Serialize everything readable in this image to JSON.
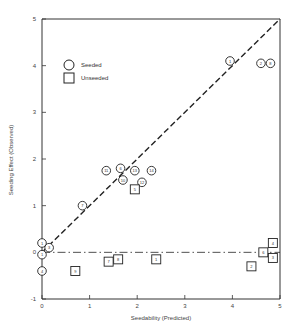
{
  "chart_data": {
    "type": "scatter",
    "title": "",
    "xlabel": "Seedability (Predicted)",
    "ylabel": "Seeding Effect (Observed)",
    "xlim": [
      0,
      5
    ],
    "ylim": [
      -1,
      5
    ],
    "x_ticks": [
      "0",
      "1",
      "2",
      "3",
      "4",
      "5"
    ],
    "y_ticks": [
      "-1",
      "0",
      "1",
      "2",
      "3",
      "4",
      "5"
    ],
    "grid": false,
    "legend": {
      "position": "upper-left",
      "entries": [
        {
          "label": "Seeded",
          "marker": "circle"
        },
        {
          "label": "Unseeded",
          "marker": "square"
        }
      ]
    },
    "reference_lines": [
      {
        "name": "identity",
        "style": "dashed",
        "from": [
          0,
          0
        ],
        "to": [
          5,
          5
        ]
      },
      {
        "name": "zero",
        "style": "dash-dot",
        "from": [
          0,
          0
        ],
        "to": [
          5,
          0
        ]
      }
    ],
    "series": [
      {
        "name": "Seeded",
        "marker": "circle",
        "points": [
          {
            "label": "1",
            "x": 0.0,
            "y": 0.2
          },
          {
            "label": "1",
            "x": 0.0,
            "y": -0.05
          },
          {
            "label": "3",
            "x": 0.15,
            "y": 0.1
          },
          {
            "label": "4",
            "x": 0.0,
            "y": -0.4
          },
          {
            "label": "7",
            "x": 0.85,
            "y": 1.0
          },
          {
            "label": "11",
            "x": 1.35,
            "y": 1.75
          },
          {
            "label": "6",
            "x": 1.65,
            "y": 1.8
          },
          {
            "label": "10",
            "x": 1.7,
            "y": 1.55
          },
          {
            "label": "13",
            "x": 1.95,
            "y": 1.75
          },
          {
            "label": "12",
            "x": 2.1,
            "y": 1.5
          },
          {
            "label": "14",
            "x": 2.3,
            "y": 1.75
          },
          {
            "label": "1",
            "x": 3.95,
            "y": 4.1
          },
          {
            "label": "2",
            "x": 4.6,
            "y": 4.05
          },
          {
            "label": "8",
            "x": 4.8,
            "y": 4.05
          }
        ]
      },
      {
        "name": "Unseeded",
        "marker": "square",
        "points": [
          {
            "label": "9",
            "x": 0.7,
            "y": -0.4
          },
          {
            "label": "7",
            "x": 1.4,
            "y": -0.2
          },
          {
            "label": "8",
            "x": 1.6,
            "y": -0.15
          },
          {
            "label": "5",
            "x": 1.95,
            "y": 1.35
          },
          {
            "label": "1",
            "x": 2.4,
            "y": -0.15
          },
          {
            "label": "2",
            "x": 4.4,
            "y": -0.3
          },
          {
            "label": "6",
            "x": 4.65,
            "y": 0.0
          },
          {
            "label": "4",
            "x": 4.85,
            "y": 0.2
          },
          {
            "label": "3",
            "x": 4.85,
            "y": -0.12
          }
        ]
      }
    ]
  }
}
